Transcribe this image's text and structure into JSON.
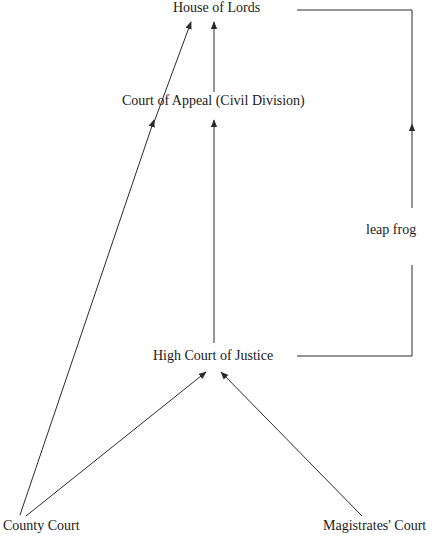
{
  "diagram": {
    "nodes": {
      "house_of_lords": "House of Lords",
      "court_of_appeal": "Court of Appeal (Civil Division)",
      "high_court": "High Court of Justice",
      "county_court": "County Court",
      "magistrates_court": "Magistrates' Court"
    },
    "labels": {
      "leap_frog": "leap frog"
    },
    "edges": [
      {
        "from": "Court of Appeal (Civil Division)",
        "to": "House of Lords"
      },
      {
        "from": "County Court",
        "to": "House of Lords"
      },
      {
        "from": "County Court",
        "to": "Court of Appeal (Civil Division)"
      },
      {
        "from": "High Court of Justice",
        "to": "Court of Appeal (Civil Division)"
      },
      {
        "from": "County Court",
        "to": "High Court of Justice"
      },
      {
        "from": "Magistrates' Court",
        "to": "High Court of Justice"
      },
      {
        "from": "High Court of Justice",
        "to": "House of Lords",
        "label": "leap frog"
      }
    ],
    "colors": {
      "line": "#2a2a2a",
      "text": "#1a1a1a",
      "background": "#ffffff"
    }
  }
}
